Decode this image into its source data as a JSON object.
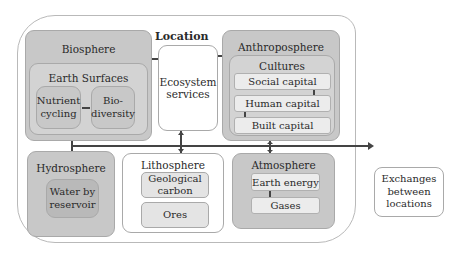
{
  "diagram": {
    "location_label": "Location",
    "biosphere": {
      "label": "Biosphere",
      "earth_surfaces": {
        "label": "Earth Surfaces",
        "items": [
          "Nutrient cycling",
          "Bio-diversity"
        ]
      }
    },
    "ecosystem_services": "Ecosystem services",
    "anthroposphere": {
      "label": "Anthroposphere",
      "cultures": {
        "label": "Cultures",
        "items": [
          "Social capital",
          "Human capital",
          "Built capital"
        ]
      }
    },
    "hydrosphere": {
      "label": "Hydrosphere",
      "items": [
        "Water by reservoir"
      ]
    },
    "lithosphere": {
      "label": "Lithosphere",
      "items": [
        "Geological carbon",
        "Ores"
      ]
    },
    "atmosphere": {
      "label": "Atmosphere",
      "items": [
        "Earth energy",
        "Gases"
      ]
    },
    "exchanges": "Exchanges between locations",
    "colors": {
      "sphere_fill": "#c8c8c8",
      "inner_fill": "#d3d3d3",
      "bar_fill": "#ececec",
      "connector": "#444444"
    }
  }
}
